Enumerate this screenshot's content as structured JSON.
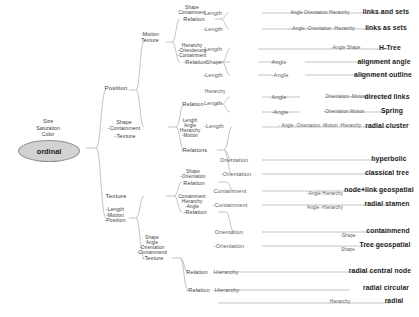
{
  "diagram": {
    "root": {
      "attributes": "Size\nSaturation\nColor",
      "oval_label": "ordinal"
    },
    "branch_nodes": [
      {
        "id": "position",
        "label": "Position"
      },
      {
        "id": "motion-texture",
        "label": "-Motion\nTexture"
      },
      {
        "id": "shape-cont",
        "label": "Shape\nContainment"
      },
      {
        "id": "rel-1",
        "label": "Relation"
      },
      {
        "id": "hier-orient",
        "label": "Hierarchy\n-Orienderung\n-Containment"
      },
      {
        "id": "rel-2",
        "label": "-Relation"
      },
      {
        "id": "shape-notcont",
        "label": "Shape\n-Containment"
      },
      {
        "id": "not-texture",
        "label": "-Texture"
      },
      {
        "id": "rel-3",
        "label": "Relation"
      },
      {
        "id": "len-angle",
        "label": "Length\nAngle\nHierarchy\n-Motion"
      },
      {
        "id": "rel-4",
        "label": "-Relations"
      },
      {
        "id": "texture",
        "label": "Texture"
      },
      {
        "id": "len-motion-pos",
        "label": "-Length\n-Motion\n-Position"
      },
      {
        "id": "shape-orient",
        "label": "Shape\n-Orientation"
      },
      {
        "id": "rel-5",
        "label": "Relation"
      },
      {
        "id": "cont-hier",
        "label": "Containment\nHierarchy\n-Angle"
      },
      {
        "id": "rel-6",
        "label": "-Relation"
      },
      {
        "id": "shape-angle",
        "label": "Shape\nAngle\n-Orientation\n-Containmend"
      },
      {
        "id": "not-texture-2",
        "label": "-Texture"
      },
      {
        "id": "rel-7",
        "label": "Relation"
      },
      {
        "id": "rel-8",
        "label": "-Relation"
      }
    ],
    "edge_labels": [
      {
        "id": "e1",
        "text": "Length"
      },
      {
        "id": "e2",
        "text": "-Length"
      },
      {
        "id": "e3",
        "text": "Angle Orientation Hierarchy"
      },
      {
        "id": "e4",
        "text": "-Angle   -Orientation   -Hierarchy"
      },
      {
        "id": "e5",
        "text": "Length"
      },
      {
        "id": "e6",
        "text": "-Shape"
      },
      {
        "id": "e7",
        "text": "-Length"
      },
      {
        "id": "e8",
        "text": "-Angle    Shape"
      },
      {
        "id": "e9",
        "text": "Angle"
      },
      {
        "id": "e10",
        "text": "-Angle"
      },
      {
        "id": "e11",
        "text": "Hierarchy"
      },
      {
        "id": "e12",
        "text": "Length"
      },
      {
        "id": "e13",
        "text": "-Length"
      },
      {
        "id": "e14",
        "text": "Angle"
      },
      {
        "id": "e15",
        "text": "-Angle"
      },
      {
        "id": "e16",
        "text": "Orientation   -Motion"
      },
      {
        "id": "e17",
        "text": "-Orientation   Motion"
      },
      {
        "id": "e18",
        "text": "- Angle  -Orientation   -Motion   -Hierarchy"
      },
      {
        "id": "e19",
        "text": "Orientation"
      },
      {
        "id": "e20",
        "text": "-Orientation"
      },
      {
        "id": "e21",
        "text": "Containment"
      },
      {
        "id": "e22",
        "text": "-Containment"
      },
      {
        "id": "e23",
        "text": "-Angle    Hierarchy"
      },
      {
        "id": "e24",
        "text": "Angle   -Hierarchy"
      },
      {
        "id": "e25",
        "text": "Orientation"
      },
      {
        "id": "e26",
        "text": "-Orientation"
      },
      {
        "id": "e27",
        "text": "-Shape"
      },
      {
        "id": "e28",
        "text": "Shape"
      },
      {
        "id": "e29",
        "text": "Hierarchy"
      },
      {
        "id": "e30",
        "text": "-Hierarchy"
      },
      {
        "id": "e31",
        "text": "Hierarchy"
      }
    ],
    "leaves": [
      {
        "id": "l1",
        "text": "links and sets"
      },
      {
        "id": "l2",
        "text": "links as sets"
      },
      {
        "id": "l3",
        "text": "H-Tree"
      },
      {
        "id": "l4",
        "text": "alignment angle"
      },
      {
        "id": "l5",
        "text": "alignment outline"
      },
      {
        "id": "l6",
        "text": "directed links"
      },
      {
        "id": "l7",
        "text": "Spring"
      },
      {
        "id": "l8",
        "text": "radial cluster"
      },
      {
        "id": "l9",
        "text": "hyperbolic"
      },
      {
        "id": "l10",
        "text": "classical tree"
      },
      {
        "id": "l11",
        "text": "node+link geospatial"
      },
      {
        "id": "l12",
        "text": "radial stamen"
      },
      {
        "id": "l13",
        "text": "containmend"
      },
      {
        "id": "l14",
        "text": "Tree geospatial"
      },
      {
        "id": "l15",
        "text": "radial central node"
      },
      {
        "id": "l16",
        "text": "radial circular"
      },
      {
        "id": "l17",
        "text": "radial"
      }
    ],
    "colors": {
      "wire": "#b4b4b4",
      "oval_fill": "#d2d2d2",
      "oval_stroke": "#8f8f8f",
      "text": "#3b3b3b",
      "leaf_text": "#1d1d1d"
    }
  }
}
